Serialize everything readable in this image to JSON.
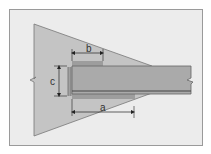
{
  "diagram": {
    "type": "structural-detail",
    "colors": {
      "background": "#ffffff",
      "frame_fill": "#ececec",
      "frame_border": "#9a9a9a",
      "support_fill": "#c4c4c4",
      "beam_fill": "#a9a9a9",
      "beam_edge": "#555555",
      "plate_fill": "#9a9a9a",
      "dim_line": "#222222"
    },
    "dimensions": [
      {
        "id": "a",
        "label": "a"
      },
      {
        "id": "b",
        "label": "b"
      },
      {
        "id": "c",
        "label": "c"
      }
    ]
  }
}
